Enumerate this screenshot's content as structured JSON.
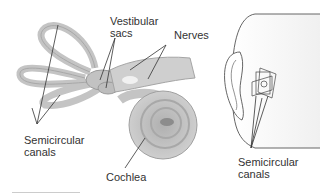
{
  "figure": {
    "labels": {
      "vestibular_sacs": [
        "Vestibular",
        "sacs"
      ],
      "nerves": "Nerves",
      "semicircular_canals_left": [
        "Semicircular",
        "canals"
      ],
      "cochlea": "Cochlea",
      "semicircular_canals_right": [
        "Semicircular",
        "canals"
      ]
    },
    "colors": {
      "organ_fill": "#c9c9c9",
      "organ_stroke": "#9a9a9a",
      "leader_line": "#333333",
      "head_outline": "#555555"
    }
  }
}
